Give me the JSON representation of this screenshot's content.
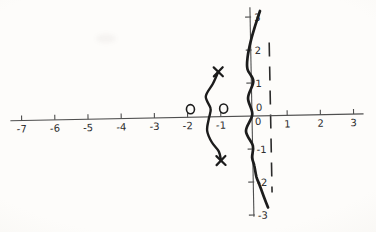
{
  "chart_data": {
    "type": "line",
    "title": "",
    "xlabel": "",
    "ylabel": "",
    "xlim": [
      -7.4,
      3.3
    ],
    "ylim": [
      -3.4,
      3.4
    ],
    "grid": false,
    "legend": null,
    "x_ticks": [
      -7,
      -6,
      -5,
      -4,
      -3,
      -2,
      -1,
      0,
      1,
      2,
      3
    ],
    "x_tick_labels": [
      "-7",
      "-6",
      "-5",
      "-4",
      "-3",
      "-2",
      "-1",
      "0",
      "1",
      "2",
      "3"
    ],
    "y_ticks": [
      3,
      2,
      1,
      0,
      -1,
      -2,
      -3
    ],
    "y_tick_labels": [
      "3",
      "2",
      "1",
      "0",
      "-1",
      "-2",
      "-3"
    ],
    "series": [
      {
        "name": "imaginary-axis-branch",
        "points": [
          [
            0.24,
            3.18
          ],
          [
            0.06,
            2.65
          ],
          [
            -0.06,
            2.25
          ],
          [
            -0.16,
            1.78
          ],
          [
            -0.17,
            1.42
          ],
          [
            0.0,
            1.05
          ],
          [
            -0.17,
            0.55
          ],
          [
            -0.05,
            0.05
          ],
          [
            -0.25,
            -0.45
          ],
          [
            -0.05,
            -0.9
          ],
          [
            -0.08,
            -1.25
          ],
          [
            -0.02,
            -1.5
          ],
          [
            0.04,
            -1.85
          ],
          [
            0.13,
            -2.1
          ],
          [
            0.25,
            -2.45
          ],
          [
            0.37,
            -2.78
          ]
        ]
      },
      {
        "name": "complex-pole-branch",
        "points": [
          [
            -1.05,
            1.36
          ],
          [
            -1.22,
            1.0
          ],
          [
            -1.44,
            0.62
          ],
          [
            -1.3,
            0.25
          ],
          [
            -1.36,
            -0.05
          ],
          [
            -1.42,
            -0.42
          ],
          [
            -1.28,
            -0.78
          ],
          [
            -1.08,
            -1.05
          ],
          [
            -1.02,
            -1.33
          ]
        ]
      }
    ],
    "zero_markers": [
      [
        -2,
        0
      ],
      [
        -1,
        0
      ]
    ],
    "pole_markers": [
      [
        -1.05,
        1.36
      ],
      [
        -1.02,
        -1.33
      ]
    ],
    "asymptote": {
      "x": 0.5,
      "y_from": -2.33,
      "y_to": 2.22,
      "style": "dashed"
    },
    "colors": {
      "ink": "#1c1c1c",
      "axis": "#4f4f4f",
      "labels": "#2e2e2e",
      "paper": "#fbfaf7"
    }
  }
}
